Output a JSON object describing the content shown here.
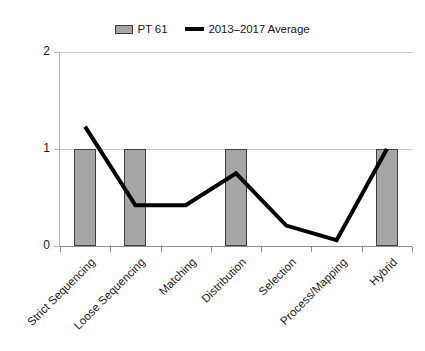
{
  "chart_data": {
    "type": "bar",
    "title": "",
    "subtitle": "",
    "xlabel": "",
    "ylabel": "",
    "ylim": [
      0,
      2
    ],
    "yticks": [
      "0",
      "1",
      "2"
    ],
    "grid": true,
    "legend_position": "top-center",
    "categories": [
      "Strict Sequencing",
      "Loose Sequencing",
      "Matching",
      "Distribution",
      "Selection",
      "Process/Mapping",
      "Hybrid"
    ],
    "series": [
      {
        "name": "PT 61",
        "type": "bar",
        "color": "#a6a6a6",
        "values": [
          1,
          1,
          0,
          1,
          0,
          0,
          1
        ]
      },
      {
        "name": "2013–2017 Average",
        "type": "line",
        "color": "#000000",
        "values": [
          1.23,
          0.42,
          0.42,
          0.75,
          0.21,
          0.06,
          1.0
        ]
      }
    ]
  },
  "legend": {
    "entries": [
      {
        "label": "PT 61",
        "swatch": "bar-swatch",
        "color": "#a6a6a6"
      },
      {
        "label": "2013–2017 Average",
        "swatch": "line-swatch",
        "color": "#000000"
      }
    ]
  },
  "axes": {
    "y": {
      "ticks": [
        "0",
        "1",
        "2"
      ],
      "min": 0,
      "max": 2
    },
    "x": {
      "ticks": [
        "Strict Sequencing",
        "Loose Sequencing",
        "Matching",
        "Distribution",
        "Selection",
        "Process/Mapping",
        "Hybrid"
      ]
    }
  }
}
